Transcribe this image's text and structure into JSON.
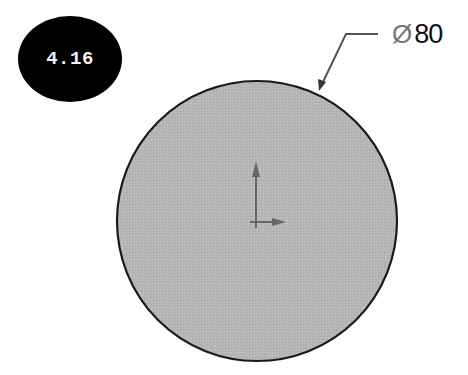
{
  "figure": {
    "badge_label": "4.16",
    "dimension": {
      "symbol": "Ø",
      "value": "80"
    },
    "shape": "circle",
    "colors": {
      "badge_fill": "#000000",
      "circle_fill": "#b4b4b4",
      "circle_stroke": "#1a1a1a",
      "axes": "#666666",
      "leader": "#555555"
    }
  }
}
